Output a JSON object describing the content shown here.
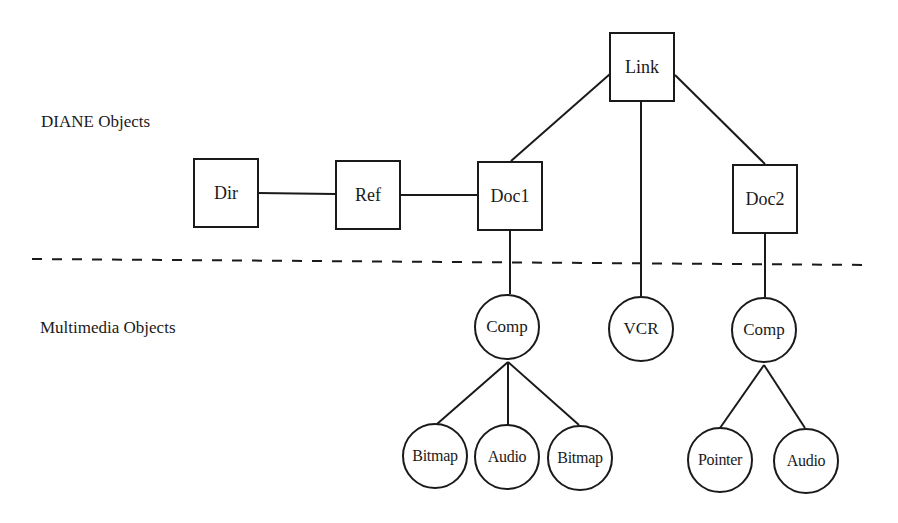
{
  "diagram": {
    "layers": {
      "upper": "DIANE Objects",
      "lower": "Multimedia Objects"
    },
    "nodes": [
      {
        "id": "link",
        "label": "Link",
        "shape": "box",
        "layer": "DIANE"
      },
      {
        "id": "dir",
        "label": "Dir",
        "shape": "box",
        "layer": "DIANE"
      },
      {
        "id": "ref",
        "label": "Ref",
        "shape": "box",
        "layer": "DIANE"
      },
      {
        "id": "doc1",
        "label": "Doc1",
        "shape": "box",
        "layer": "DIANE"
      },
      {
        "id": "doc2",
        "label": "Doc2",
        "shape": "box",
        "layer": "DIANE"
      },
      {
        "id": "comp1",
        "label": "Comp",
        "shape": "circle",
        "layer": "Multimedia"
      },
      {
        "id": "vcr",
        "label": "VCR",
        "shape": "circle",
        "layer": "Multimedia"
      },
      {
        "id": "comp2",
        "label": "Comp",
        "shape": "circle",
        "layer": "Multimedia"
      },
      {
        "id": "bitmap1",
        "label": "Bitmap",
        "shape": "circle",
        "layer": "Multimedia"
      },
      {
        "id": "audio1",
        "label": "Audio",
        "shape": "circle",
        "layer": "Multimedia"
      },
      {
        "id": "bitmap2",
        "label": "Bitmap",
        "shape": "circle",
        "layer": "Multimedia"
      },
      {
        "id": "pointer",
        "label": "Pointer",
        "shape": "circle",
        "layer": "Multimedia"
      },
      {
        "id": "audio2",
        "label": "Audio",
        "shape": "circle",
        "layer": "Multimedia"
      }
    ],
    "edges": [
      [
        "dir",
        "ref"
      ],
      [
        "ref",
        "doc1"
      ],
      [
        "link",
        "doc1"
      ],
      [
        "link",
        "vcr"
      ],
      [
        "link",
        "doc2"
      ],
      [
        "doc1",
        "comp1"
      ],
      [
        "doc2",
        "comp2"
      ],
      [
        "comp1",
        "bitmap1"
      ],
      [
        "comp1",
        "audio1"
      ],
      [
        "comp1",
        "bitmap2"
      ],
      [
        "comp2",
        "pointer"
      ],
      [
        "comp2",
        "audio2"
      ]
    ],
    "separator": "dashed"
  },
  "labels": {
    "upper_layer": "DIANE Objects",
    "lower_layer": "Multimedia Objects",
    "link": "Link",
    "dir": "Dir",
    "ref": "Ref",
    "doc1": "Doc1",
    "doc2": "Doc2",
    "comp1": "Comp",
    "vcr": "VCR",
    "comp2": "Comp",
    "bitmap1": "Bitmap",
    "audio1": "Audio",
    "bitmap2": "Bitmap",
    "pointer": "Pointer",
    "audio2": "Audio"
  }
}
